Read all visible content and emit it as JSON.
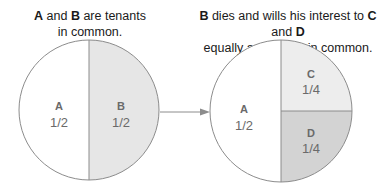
{
  "captions": {
    "left": {
      "parts": [
        {
          "text": "A",
          "bold": true
        },
        {
          "text": " and ",
          "bold": false
        },
        {
          "text": "B",
          "bold": true
        },
        {
          "text": " are tenants",
          "bold": false
        }
      ],
      "line2": "in common."
    },
    "right": {
      "parts": [
        {
          "text": "B",
          "bold": true
        },
        {
          "text": " dies and wills his interest to ",
          "bold": false
        },
        {
          "text": "C",
          "bold": true
        },
        {
          "text": " and ",
          "bold": false
        },
        {
          "text": "D",
          "bold": true
        }
      ],
      "line2": "equally as tenants in common."
    }
  },
  "before": {
    "title": "Tenancy in common before",
    "shares": [
      {
        "owner": "A",
        "fraction": "1/2",
        "fill": "#ffffff"
      },
      {
        "owner": "B",
        "fraction": "1/2",
        "fill": "#e6e6e6"
      }
    ]
  },
  "after": {
    "title": "Tenancy in common after",
    "shares": [
      {
        "owner": "A",
        "fraction": "1/2",
        "fill": "#ffffff"
      },
      {
        "owner": "C",
        "fraction": "1/4",
        "fill": "#ededed"
      },
      {
        "owner": "D",
        "fraction": "1/4",
        "fill": "#d3d3d3"
      }
    ]
  },
  "arrow": {
    "direction": "right",
    "meaning": "transfer of B's interest"
  },
  "colors": {
    "outline": "#8c8c8c",
    "label": "#6a6a6a",
    "caption": "#1a1a1a"
  }
}
